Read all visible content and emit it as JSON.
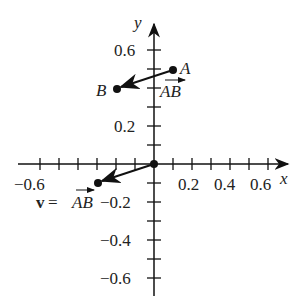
{
  "diagram": {
    "axes": {
      "x_label": "x",
      "y_label": "y",
      "x_tick_labels": [
        "−0.6",
        "0.2",
        "0.4",
        "0.6"
      ],
      "y_tick_labels": [
        "0.6",
        "0.2",
        "−0.2",
        "−0.4",
        "−0.6"
      ],
      "tick_step": 0.1,
      "range": [
        -0.7,
        0.7
      ]
    },
    "points": [
      {
        "name": "A",
        "x": 0.1,
        "y": 0.5
      },
      {
        "name": "B",
        "x": -0.2,
        "y": 0.4
      }
    ],
    "vectors": [
      {
        "name": "AB",
        "label": "AB",
        "from": [
          0.1,
          0.5
        ],
        "to": [
          -0.2,
          0.4
        ]
      },
      {
        "name": "v",
        "label_prefix": "v = ",
        "label": "AB",
        "from": [
          0,
          0
        ],
        "to": [
          -0.3,
          -0.1
        ]
      }
    ],
    "color": "#111111"
  }
}
